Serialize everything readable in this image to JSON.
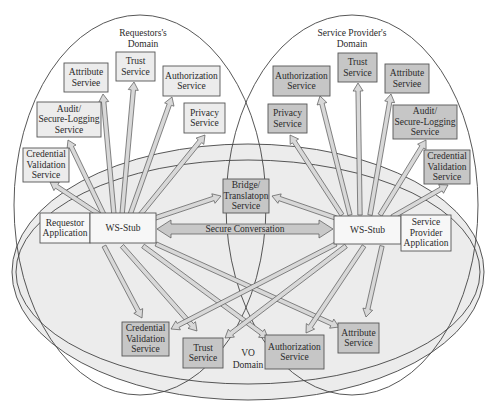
{
  "domains": {
    "requestor": {
      "label_line1": "Requestors's",
      "label_line2": "Domain"
    },
    "provider": {
      "label_line1": "Service Provider's",
      "label_line2": "Domain"
    },
    "vo": {
      "label_line1": "VO",
      "label_line2": "Domain"
    }
  },
  "requestor_services": {
    "attribute": [
      "Attribute",
      "Serviee"
    ],
    "trust": [
      "Trust",
      "Service"
    ],
    "authorization": [
      "Authorization",
      "Service"
    ],
    "audit": [
      "Audit/",
      "Secure-Logging",
      "Service"
    ],
    "privacy": [
      "Privacy",
      "Service"
    ],
    "credential": [
      "Credential",
      "Validation",
      "Service"
    ]
  },
  "provider_services": {
    "authorization": [
      "Authorization",
      "Service"
    ],
    "trust": [
      "Trust",
      "Service"
    ],
    "attribute": [
      "Attribute",
      "Serviee"
    ],
    "privacy": [
      "Privacy",
      "Service"
    ],
    "audit": [
      "Audit/",
      "Secure-Logging",
      "Service"
    ],
    "credential": [
      "Credential",
      "Validation",
      "Service"
    ]
  },
  "vo_services": {
    "bridge": [
      "Bridge/",
      "Translatopn",
      "Service"
    ],
    "credential": [
      "Credential",
      "Validation",
      "Service"
    ],
    "trust": [
      "Trust",
      "Service"
    ],
    "authorization": [
      "Authorization",
      "Service"
    ],
    "attribute": [
      "Attribute",
      "Service"
    ]
  },
  "applications": {
    "requestor_app": [
      "Requestor",
      "Application"
    ],
    "requestor_stub": "WS-Stub",
    "provider_stub": "WS-Stub",
    "provider_app": [
      "Service",
      "Provider",
      "Application"
    ]
  },
  "connection": {
    "secure_conversation": "Secure Conversation"
  },
  "colors": {
    "light_box": "#ececec",
    "dark_box": "#c6c6c6",
    "vo_fill": "#ececec",
    "stroke": "#444444"
  }
}
